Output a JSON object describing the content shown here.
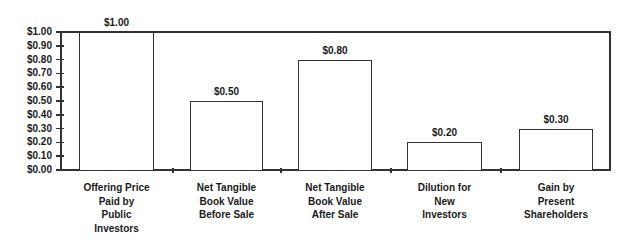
{
  "chart_data": {
    "type": "bar",
    "title": "",
    "xlabel": "",
    "ylabel": "",
    "ylim": [
      0,
      1.0
    ],
    "yticks": [
      "$0.00",
      "$0.10",
      "$0.20",
      "$0.30",
      "$0.40",
      "$0.50",
      "$0.60",
      "$0.70",
      "$0.80",
      "$0.90",
      "$1.00"
    ],
    "categories": [
      "Offering Price Paid by Public Investors",
      "Net Tangible Book Value Before Sale",
      "Net Tangible Book Value After Sale",
      "Dilution for New Investors",
      "Gain by Present Shareholders"
    ],
    "category_lines": [
      "Offering Price\nPaid by\nPublic\nInvestors",
      "Net Tangible\nBook Value\nBefore Sale",
      "Net Tangible\nBook Value\nAfter Sale",
      "Dilution for\nNew\nInvestors",
      "Gain by\nPresent\nShareholders"
    ],
    "values": [
      1.0,
      0.5,
      0.8,
      0.2,
      0.3
    ],
    "data_labels": [
      "$1.00",
      "$0.50",
      "$0.80",
      "$0.20",
      "$0.30"
    ],
    "grid": false,
    "legend": null,
    "colors": {
      "bar_fill": "#ffffff",
      "bar_stroke": "#333333",
      "axis": "#333333"
    }
  }
}
